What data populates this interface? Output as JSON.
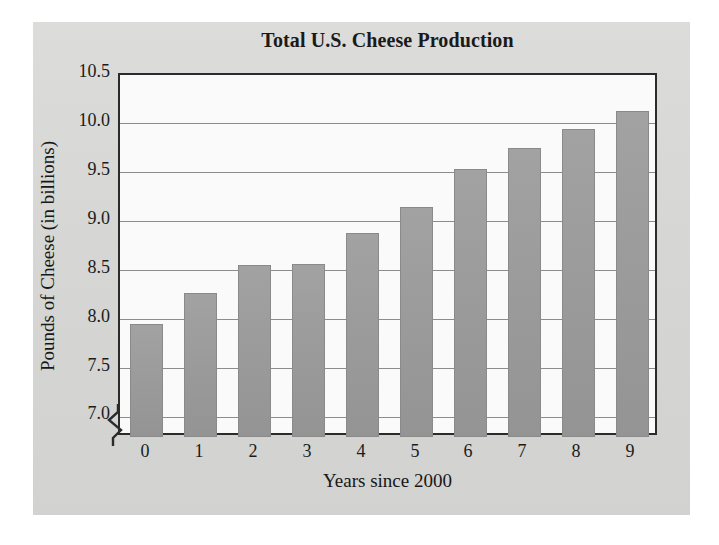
{
  "chart_data": {
    "type": "bar",
    "title": "Total U.S. Cheese Production",
    "xlabel": "Years since 2000",
    "ylabel": "Pounds of Cheese (in billions)",
    "categories": [
      "0",
      "1",
      "2",
      "3",
      "4",
      "5",
      "6",
      "7",
      "8",
      "9"
    ],
    "values": [
      7.95,
      8.27,
      8.56,
      8.57,
      8.88,
      9.15,
      9.54,
      9.75,
      9.95,
      10.13
    ],
    "ylim": [
      6.8,
      10.5
    ],
    "ytick_values": [
      10.5,
      10.0,
      9.5,
      9.0,
      8.5,
      8.0,
      7.5,
      7.0
    ],
    "ytick_labels": [
      "10.5",
      "10.0",
      "9.5",
      "9.0",
      "8.5",
      "8.0",
      "7.5",
      "7.0"
    ],
    "grid": true,
    "legend": "none",
    "axis_break": true,
    "series": [
      {
        "name": "Total U.S. Cheese Production",
        "values": [
          7.95,
          8.27,
          8.56,
          8.57,
          8.88,
          9.15,
          9.54,
          9.75,
          9.95,
          10.13
        ]
      }
    ],
    "colors": {
      "bar_fill": "#9b9b9b",
      "bar_edge": "#8a8a8a",
      "plot_background": "#fafafa",
      "figure_background": "#d8d8d6",
      "axis": "#2b2b2b",
      "gridline": "#8c8c8c",
      "text": "#1b1b1b"
    }
  },
  "icons": {
    "axis_break": "zigzag-break-icon"
  }
}
